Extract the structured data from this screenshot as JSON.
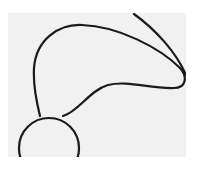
{
  "figure": {
    "background_color": "#f1f1f1",
    "page_color": "#ffffff",
    "stroke_color": "#1a1a1a",
    "stroke_width": 2.2,
    "elements": [
      {
        "name": "base-circle",
        "shape": "circle",
        "cx": 49,
        "cy": 148,
        "r": 30
      },
      {
        "name": "lobe-outline",
        "shape": "path",
        "d": "M40,116 C36,100 33,85 34,68 C36,40 58,24 82,25 C118,26 160,48 180,68 C188,77 186,88 174,88 C150,89 128,80 108,85 C90,90 78,112 63,116"
      },
      {
        "name": "outer-arc",
        "shape": "path",
        "d": "M134,14 C156,30 176,52 186,75"
      }
    ]
  }
}
